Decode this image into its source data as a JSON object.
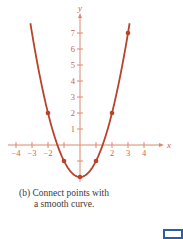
{
  "chart_data": {
    "type": "line",
    "title": "",
    "function": "y = x^2 - 2",
    "xlabel": "x",
    "ylabel": "y",
    "xlim": [
      -4.5,
      5
    ],
    "ylim": [
      -2.3,
      8
    ],
    "grid": false,
    "legend": null,
    "x_ticks": [
      -4,
      -3,
      -2,
      -1,
      1,
      2,
      3,
      4
    ],
    "x_tick_labels": [
      "−4",
      "−3",
      "−2",
      "",
      "",
      "2",
      "3",
      "4"
    ],
    "y_ticks": [
      -1,
      1,
      2,
      3,
      4,
      5,
      6,
      7
    ],
    "y_tick_labels": [
      "",
      "1",
      "2",
      "3",
      "4",
      "5",
      "6",
      "7"
    ],
    "points": [
      {
        "x": -2,
        "y": 2
      },
      {
        "x": -1,
        "y": -1
      },
      {
        "x": 0,
        "y": -2
      },
      {
        "x": 1,
        "y": -1
      },
      {
        "x": 2,
        "y": 2
      },
      {
        "x": 3,
        "y": 7
      }
    ],
    "curve_domain": [
      -3.1,
      3.1
    ],
    "colors": {
      "curve": "#b8432a",
      "axis": "#d98a6e",
      "text": "#c8664a"
    }
  },
  "caption": {
    "label": "(b)",
    "line1": "Connect points with",
    "line2": "a smooth curve."
  }
}
